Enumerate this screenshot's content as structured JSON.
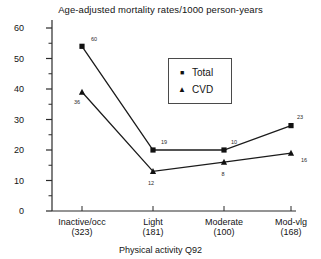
{
  "chart_data": {
    "type": "line",
    "title": "Age-adjusted mortality rates/1000 person-years",
    "xlabel": "Physical activity Q92",
    "ylabel": "",
    "ylim": [
      0,
      60
    ],
    "ytick_step": 10,
    "minor_tick_step": 5,
    "grid": false,
    "legend_position": "inside-upper-center-right",
    "categories": [
      "Inactive/occ",
      "Light",
      "Moderate",
      "Mod-vlg"
    ],
    "category_counts": [
      "(323)",
      "(181)",
      "(100)",
      "(168)"
    ],
    "yticks": [
      0,
      10,
      20,
      30,
      40,
      50,
      60
    ],
    "series": [
      {
        "name": "Total",
        "marker": "square",
        "values": [
          54,
          20,
          20,
          28
        ],
        "point_labels": [
          "60",
          "19",
          "10",
          "23"
        ]
      },
      {
        "name": "CVD",
        "marker": "triangle",
        "values": [
          39,
          13,
          16,
          19
        ],
        "point_labels": [
          "36",
          "12",
          "8",
          "16"
        ]
      }
    ]
  },
  "legend": {
    "items": [
      {
        "label": "Total",
        "glyph": "■"
      },
      {
        "label": "CVD",
        "glyph": "▲"
      }
    ]
  }
}
